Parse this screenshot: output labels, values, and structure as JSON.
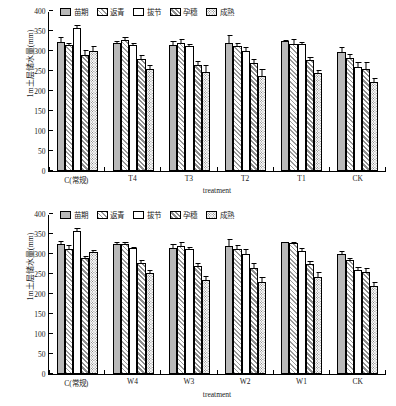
{
  "figure": {
    "ylabel": "1m土层储水量(mm)",
    "xlabel": "treatment",
    "legend": [
      {
        "label": "苗期",
        "pattern": "solid"
      },
      {
        "label": "返青",
        "pattern": "diagonal-hatch"
      },
      {
        "label": "拔节",
        "pattern": "open"
      },
      {
        "label": "孕穗",
        "pattern": "dense-hatch"
      },
      {
        "label": "成熟",
        "pattern": "dotted"
      }
    ],
    "yticks": [
      0,
      50,
      100,
      150,
      200,
      250,
      300,
      350,
      400
    ]
  },
  "chart_data": [
    {
      "type": "bar",
      "panel": "top",
      "title": "",
      "xlabel": "treatment",
      "ylabel": "1m土层储水量(mm)",
      "ylim": [
        0,
        400
      ],
      "yticks": [
        0,
        50,
        100,
        150,
        200,
        250,
        300,
        350,
        400
      ],
      "grid": false,
      "legend_position": "top-center",
      "categories": [
        "C(常规)",
        "T4",
        "T3",
        "T2",
        "T1",
        "CK"
      ],
      "series": [
        {
          "name": "苗期",
          "pattern": "solid",
          "values": [
            323,
            320,
            315,
            321,
            325,
            298
          ],
          "errors": [
            12,
            5,
            11,
            18,
            3,
            12
          ]
        },
        {
          "name": "返青",
          "pattern": "diagonal-hatch",
          "values": [
            316,
            327,
            320,
            313,
            318,
            283
          ],
          "errors": [
            4,
            9,
            11,
            8,
            13,
            9
          ]
        },
        {
          "name": "拔节",
          "pattern": "open",
          "values": [
            357,
            315,
            312,
            299,
            317,
            261
          ],
          "errors": [
            8,
            4,
            6,
            10,
            6,
            11
          ]
        },
        {
          "name": "孕穗",
          "pattern": "dense-hatch",
          "values": [
            289,
            281,
            266,
            270,
            277,
            256
          ],
          "errors": [
            13,
            8,
            8,
            9,
            7,
            17
          ]
        },
        {
          "name": "成熟",
          "pattern": "dotted",
          "values": [
            301,
            256,
            248,
            238,
            245,
            222
          ],
          "errors": [
            11,
            8,
            17,
            18,
            8,
            11
          ]
        }
      ]
    },
    {
      "type": "bar",
      "panel": "bottom",
      "title": "",
      "xlabel": "treatment",
      "ylabel": "1m土层储水量(mm)",
      "ylim": [
        0,
        400
      ],
      "yticks": [
        0,
        50,
        100,
        150,
        200,
        250,
        300,
        350,
        400
      ],
      "grid": false,
      "legend_position": "top-center",
      "categories": [
        "C(常规)",
        "W4",
        "W3",
        "W2",
        "W1",
        "CK"
      ],
      "series": [
        {
          "name": "苗期",
          "pattern": "solid",
          "values": [
            325,
            325,
            315,
            320,
            329,
            299
          ],
          "errors": [
            8,
            4,
            11,
            18,
            2,
            9
          ]
        },
        {
          "name": "返青",
          "pattern": "diagonal-hatch",
          "values": [
            313,
            324,
            321,
            312,
            328,
            284
          ],
          "errors": [
            9,
            7,
            10,
            11,
            2,
            6
          ]
        },
        {
          "name": "拔节",
          "pattern": "open",
          "values": [
            357,
            314,
            312,
            300,
            308,
            261
          ],
          "errors": [
            7,
            4,
            6,
            13,
            7,
            7
          ]
        },
        {
          "name": "孕穗",
          "pattern": "dense-hatch",
          "values": [
            291,
            278,
            269,
            264,
            275,
            256
          ],
          "errors": [
            3,
            7,
            9,
            14,
            8,
            10
          ]
        },
        {
          "name": "成熟",
          "pattern": "dotted",
          "values": [
            304,
            253,
            236,
            231,
            242,
            221
          ],
          "errors": [
            7,
            7,
            9,
            11,
            14,
            9
          ]
        }
      ]
    }
  ]
}
